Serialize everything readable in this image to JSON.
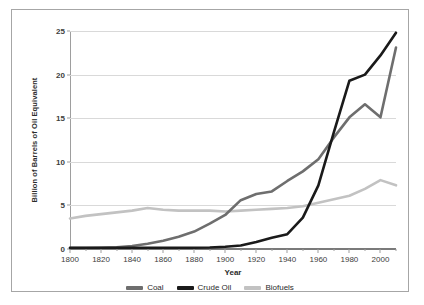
{
  "chart_data": {
    "type": "line",
    "title": "",
    "xlabel": "Year",
    "ylabel": "Billion of Barrels of Oil Equivalent",
    "xlim": [
      1800,
      2010
    ],
    "ylim": [
      0,
      25
    ],
    "xticks": [
      1800,
      1820,
      1840,
      1860,
      1880,
      1900,
      1920,
      1940,
      1960,
      1980,
      2000
    ],
    "yticks": [
      0,
      5,
      10,
      15,
      20,
      25
    ],
    "grid": "horizontal",
    "legend_position": "bottom-center",
    "x": [
      1800,
      1810,
      1820,
      1830,
      1840,
      1850,
      1860,
      1870,
      1880,
      1890,
      1900,
      1910,
      1920,
      1930,
      1940,
      1950,
      1960,
      1970,
      1980,
      1990,
      2000,
      2010
    ],
    "series": [
      {
        "name": "Coal",
        "color": "#6e6e6e",
        "values": [
          0.1,
          0.12,
          0.15,
          0.2,
          0.35,
          0.6,
          0.95,
          1.4,
          2.0,
          2.9,
          3.9,
          5.6,
          6.3,
          6.6,
          7.8,
          8.9,
          10.3,
          12.8,
          15.1,
          16.6,
          15.1,
          23.1
        ]
      },
      {
        "name": "Crude Oil",
        "color": "#1a1a1a",
        "values": [
          0.15,
          0.15,
          0.15,
          0.15,
          0.15,
          0.15,
          0.15,
          0.15,
          0.15,
          0.18,
          0.25,
          0.4,
          0.8,
          1.3,
          1.7,
          3.6,
          7.3,
          13.4,
          19.3,
          20.0,
          22.2,
          24.8
        ]
      },
      {
        "name": "Biofuels",
        "color": "#c2c2c2",
        "values": [
          3.5,
          3.8,
          4.0,
          4.2,
          4.4,
          4.7,
          4.5,
          4.4,
          4.4,
          4.4,
          4.3,
          4.4,
          4.5,
          4.6,
          4.7,
          4.9,
          5.3,
          5.7,
          6.1,
          6.9,
          7.9,
          7.3
        ]
      }
    ]
  },
  "axes": {
    "ylabel": "Billion of Barrels of Oil Equivalent",
    "xlabel": "Year"
  },
  "legend": {
    "items": [
      {
        "label": "Coal",
        "color": "#6e6e6e"
      },
      {
        "label": "Crude Oil",
        "color": "#1a1a1a"
      },
      {
        "label": "Biofuels",
        "color": "#c2c2c2"
      }
    ]
  }
}
